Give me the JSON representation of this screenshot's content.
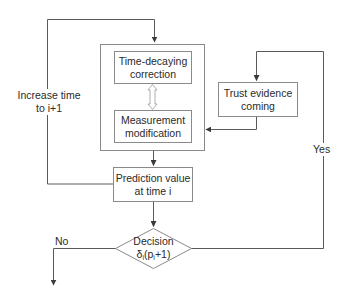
{
  "diagram": {
    "type": "flowchart",
    "nodes": {
      "correction": {
        "line1": "Time-decaying",
        "line2": "correction"
      },
      "measurement": {
        "line1": "Measurement",
        "line2": "modification"
      },
      "trust": {
        "line1": "Trust evidence",
        "line2": "coming"
      },
      "prediction": {
        "line1": "Prediction value",
        "line2": "at time i"
      },
      "decision": {
        "line1": "Decision",
        "line2_prefix": "δ",
        "line2_sub1": "i",
        "line2_mid": "(p",
        "line2_sub2": "i",
        "line2_suffix": "+1)"
      }
    },
    "edge_labels": {
      "increase_line1": "Increase time",
      "increase_line2": "to i+1",
      "yes": "Yes",
      "no": "No"
    },
    "colors": {
      "line": "#5a5a5a",
      "box_border": "#8a8a8a",
      "text": "#2a2a2a"
    }
  }
}
